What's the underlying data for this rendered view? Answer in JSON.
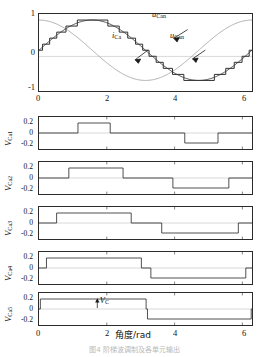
{
  "figure": {
    "xlabel": "角度/rad",
    "caption": "图4  阶梯波调制及各单元输出"
  },
  "chart_data": [
    {
      "type": "line",
      "name": "top-waveforms",
      "title": "",
      "xlabel": "",
      "ylabel": "",
      "xlim": [
        0,
        6.2832
      ],
      "ylim": [
        -1.35,
        1.2
      ],
      "xticks": [
        0,
        2,
        4,
        6
      ],
      "xticklabels": [
        "0",
        "2",
        "4",
        "6"
      ],
      "yticks": [
        -1,
        0,
        1
      ],
      "yticklabels": [
        "-1",
        "0",
        "1"
      ],
      "grid": false,
      "legend": "annotations",
      "series": [
        {
          "name": "u_Can_stepped",
          "label": "u_Can",
          "style": "staircase",
          "color": "#2b2b2b",
          "levels": 11,
          "amplitude": 1.0,
          "description": "11-level staircase approximation of sin(x)"
        },
        {
          "name": "u_Can_sine",
          "label": "u_Can",
          "style": "smooth-sine",
          "color": "#2b2b2b",
          "amplitude": 1.0,
          "phase": 0.0,
          "description": "reference sine sin(x)"
        },
        {
          "name": "i_Ca",
          "label": "i_Ca",
          "style": "smooth-cosine",
          "color": "#9b9b9b",
          "amplitude": 1.0,
          "phase": 1.5708,
          "description": "current cos(x), lighter grey trace"
        }
      ],
      "annotations": [
        {
          "id": "ann-ucan-step",
          "text": "u",
          "sub": "Can",
          "x": 2.95,
          "y": 0.72
        },
        {
          "id": "ann-ica",
          "text": "i",
          "sub": "Ca",
          "x": 2.35,
          "y": 0.18
        },
        {
          "id": "ann-ucan-sine",
          "text": "u",
          "sub": "Can",
          "x": 3.72,
          "y": 0.18
        }
      ]
    },
    {
      "type": "step",
      "name": "V_Ca1",
      "ylabel": "V_Ca1",
      "ylabel_main": "V",
      "ylabel_sub": "Ca1",
      "xlim": [
        0,
        6.2832
      ],
      "ylim": [
        -0.32,
        0.32
      ],
      "yticks": [
        -0.2,
        0,
        0.2
      ],
      "yticklabels": [
        "-0.2",
        "0",
        "0.2"
      ],
      "xticks": [
        0,
        2,
        4,
        6
      ],
      "xticklabels": [
        "0",
        "2",
        "4",
        "6"
      ],
      "show_xticklabels": false,
      "pulses": [
        {
          "start": 1.15,
          "end": 2.1,
          "level": 0.2
        },
        {
          "start": 4.3,
          "end": 5.28,
          "level": -0.2
        }
      ]
    },
    {
      "type": "step",
      "name": "V_Ca2",
      "ylabel": "V_Ca2",
      "ylabel_main": "V",
      "ylabel_sub": "Ca2",
      "xlim": [
        0,
        6.2832
      ],
      "ylim": [
        -0.32,
        0.32
      ],
      "yticks": [
        -0.2,
        0,
        0.2
      ],
      "yticklabels": [
        "-0.2",
        "0",
        "0.2"
      ],
      "xticks": [
        0,
        2,
        4,
        6
      ],
      "xticklabels": [
        "0",
        "2",
        "4",
        "6"
      ],
      "show_xticklabels": false,
      "pulses": [
        {
          "start": 0.88,
          "end": 2.48,
          "level": 0.2
        },
        {
          "start": 3.95,
          "end": 5.6,
          "level": -0.2
        }
      ]
    },
    {
      "type": "step",
      "name": "V_Ca3",
      "ylabel": "V_Ca3",
      "ylabel_main": "V",
      "ylabel_sub": "Ca3",
      "xlim": [
        0,
        6.2832
      ],
      "ylim": [
        -0.32,
        0.32
      ],
      "yticks": [
        -0.2,
        0,
        0.2
      ],
      "yticklabels": [
        "-0.2",
        "0",
        "0.2"
      ],
      "xticks": [
        0,
        2,
        4,
        6
      ],
      "xticklabels": [
        "0",
        "2",
        "4",
        "6"
      ],
      "show_xticklabels": false,
      "pulses": [
        {
          "start": 0.52,
          "end": 2.72,
          "level": 0.2
        },
        {
          "start": 3.62,
          "end": 5.88,
          "level": -0.2
        }
      ]
    },
    {
      "type": "step",
      "name": "V_Ca4",
      "ylabel": "V_Ca4",
      "ylabel_main": "V",
      "ylabel_sub": "Ca4",
      "xlim": [
        0,
        6.2832
      ],
      "ylim": [
        -0.32,
        0.32
      ],
      "yticks": [
        -0.2,
        0,
        0.2
      ],
      "yticklabels": [
        "-0.2",
        "0",
        "0.2"
      ],
      "xticks": [
        0,
        2,
        4,
        6
      ],
      "xticklabels": [
        "0",
        "2",
        "4",
        "6"
      ],
      "show_xticklabels": false,
      "pulses": [
        {
          "start": 0.22,
          "end": 3.02,
          "level": 0.2
        },
        {
          "start": 3.3,
          "end": 6.1,
          "level": -0.2
        }
      ]
    },
    {
      "type": "step",
      "name": "V_Ca5",
      "ylabel": "V_Ca5",
      "ylabel_main": "V",
      "ylabel_sub": "Ca5",
      "xlim": [
        0,
        6.2832
      ],
      "ylim": [
        -0.32,
        0.32
      ],
      "yticks": [
        -0.2,
        0,
        0.2
      ],
      "yticklabels": [
        "-0.2",
        "0",
        "0.2"
      ],
      "xticks": [
        0,
        2,
        4,
        6
      ],
      "xticklabels": [
        "0",
        "2",
        "4",
        "6"
      ],
      "show_xticklabels": true,
      "pulses": [
        {
          "start": 0.04,
          "end": 3.16,
          "level": 0.2
        },
        {
          "start": 3.2,
          "end": 6.26,
          "level": -0.2
        }
      ],
      "annotations": [
        {
          "id": "ann-vc",
          "text": "V",
          "sub": "C",
          "x": 1.72,
          "y": 0.215,
          "arrow": "up"
        }
      ]
    }
  ]
}
